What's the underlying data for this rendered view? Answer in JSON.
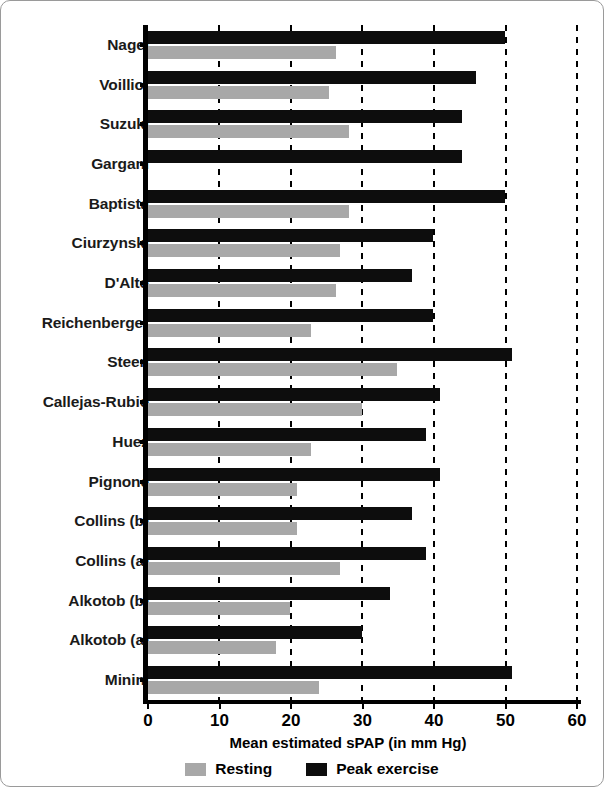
{
  "chart_data": {
    "type": "bar",
    "orientation": "horizontal",
    "title": "",
    "xlabel": "Mean estimated sPAP (in mm Hg)",
    "ylabel": "",
    "xlim": [
      0,
      60
    ],
    "xticks": [
      0,
      10,
      20,
      30,
      40,
      50,
      60
    ],
    "xtick_labels": [
      "0",
      "10",
      "20",
      "30",
      "40",
      "50",
      "60"
    ],
    "grid": "vertical-dashed",
    "legend_position": "bottom",
    "categories": [
      "Nagel",
      "Voilliot",
      "Suzuki",
      "Gargani",
      "Baptista",
      "Ciurzynski",
      "D'Alto",
      "Reichenberger",
      "Steen",
      "Callejas-Rubio",
      "Huez",
      "Pignone",
      "Collins (b)",
      "Collins (a)",
      "Alkotob (b)",
      "Alkotob (a)",
      "Minini"
    ],
    "series": [
      {
        "name": "Peak exercise",
        "color": "#0d0d0d",
        "values": [
          50,
          46,
          44,
          44,
          50,
          40,
          37,
          40,
          51,
          41,
          39,
          41,
          37,
          39,
          34,
          30,
          51
        ]
      },
      {
        "name": "Resting",
        "color": "#a8a8a8",
        "values": [
          26.5,
          25.4,
          28.3,
          null,
          28.3,
          27,
          26.5,
          23,
          35,
          30,
          23,
          21,
          21,
          27,
          20,
          18,
          24
        ]
      }
    ]
  },
  "legend": {
    "items": [
      {
        "label": "Resting",
        "swatch": "resting",
        "color": "#a8a8a8"
      },
      {
        "label": "Peak exercise",
        "swatch": "peak",
        "color": "#0d0d0d"
      }
    ]
  },
  "axis": {
    "x_title": "Mean estimated sPAP (in mm Hg)"
  }
}
